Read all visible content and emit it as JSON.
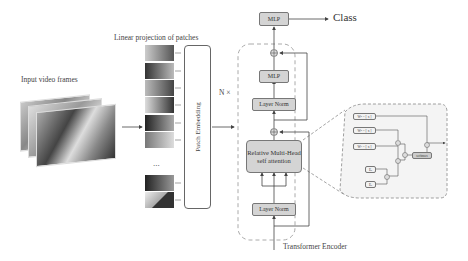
{
  "labels": {
    "input_frames": "Input video frames",
    "linear_projection": "Linear projection of patches",
    "patch_embedding": "Patch Embedding",
    "repeat": "N ×",
    "class": "Class",
    "transformer_encoder": "Transformer Encoder",
    "ellipsis": "..."
  },
  "encoder": {
    "mlp_top": "MLP",
    "mlp_inner": "MLP",
    "layer_norm_top": "Layer Norm",
    "attention": "Relative Multi-Head self attention",
    "layer_norm_bottom": "Layer Norm"
  },
  "attention_detail": {
    "w1": "W² = [ x ]",
    "w2": "W² = [ x ]",
    "w3": "W³ = [ x ]",
    "e1": "Eₐ",
    "e2": "Eₐ",
    "softmax": "softmax"
  },
  "colors": {
    "box_fill": "#d4d4d4",
    "border": "#777777",
    "dashed": "#aaaaaa",
    "panel_fill": "#f4f4f4"
  }
}
